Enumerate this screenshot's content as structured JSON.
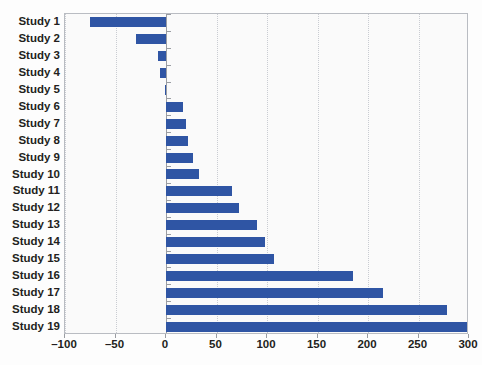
{
  "chart_data": {
    "type": "bar",
    "orientation": "horizontal",
    "title": "",
    "xlabel": "",
    "ylabel": "",
    "xlim": [
      -100,
      300
    ],
    "xticks": [
      -100,
      -50,
      0,
      50,
      100,
      150,
      200,
      250,
      300
    ],
    "xtick_labels": [
      "–100",
      "–50",
      "0",
      "50",
      "100",
      "150",
      "200",
      "250",
      "300"
    ],
    "grid": true,
    "grid_axis": "x",
    "legend": "none",
    "categories": [
      "Study 1",
      "Study 2",
      "Study 3",
      "Study 4",
      "Study 5",
      "Study 6",
      "Study 7",
      "Study 8",
      "Study 9",
      "Study 10",
      "Study 11",
      "Study 12",
      "Study 13",
      "Study 14",
      "Study 15",
      "Study 16",
      "Study 17",
      "Study 18",
      "Study 19"
    ],
    "values": [
      -75,
      -30,
      -8,
      -6,
      -1,
      17,
      20,
      22,
      27,
      33,
      65,
      72,
      90,
      98,
      107,
      185,
      215,
      278,
      300
    ],
    "series": [
      {
        "name": "Effect",
        "color": "#2f55a4",
        "values": [
          -75,
          -30,
          -8,
          -6,
          -1,
          17,
          20,
          22,
          27,
          33,
          65,
          72,
          90,
          98,
          107,
          185,
          215,
          278,
          300
        ]
      }
    ]
  },
  "colors": {
    "bar": "#2f55a4",
    "plot_background": "#fafafa",
    "frame": "#b9bcc2",
    "gridline": "#c9ccd2",
    "zero_line": "#9a9da3",
    "text": "#231f20"
  }
}
